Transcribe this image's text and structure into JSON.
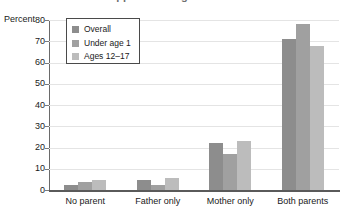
{
  "chart_data": {
    "type": "bar",
    "title": "",
    "xlabel": "",
    "ylabel": "Percent",
    "ylim": [
      0,
      80
    ],
    "yticks": [
      0,
      10,
      20,
      30,
      40,
      50,
      60,
      70,
      80
    ],
    "ytick_labels": [
      "0",
      "10",
      "20",
      "30",
      "40",
      "50",
      "60",
      "70",
      "80"
    ],
    "grid": true,
    "legend_position": "upper-left-inside",
    "categories": [
      "No parent",
      "Father only",
      "Mother only",
      "Both parents"
    ],
    "series": [
      {
        "name": "Overall",
        "color": "#8d8d8d",
        "values": [
          2.5,
          4.5,
          22,
          71
        ]
      },
      {
        "name": "Under age 1",
        "color": "#a0a0a0",
        "values": [
          4,
          2.5,
          17,
          78
        ]
      },
      {
        "name": "Ages 12–17",
        "color": "#bcbcbc",
        "values": [
          4.5,
          5.5,
          23,
          68
        ]
      }
    ]
  },
  "axis": {
    "y_title": "Percent"
  },
  "legend": {
    "entries": [
      {
        "label": "Overall",
        "color": "#8d8d8d"
      },
      {
        "label": "Under age 1",
        "color": "#a0a0a0"
      },
      {
        "label": "Ages 12–17",
        "color": "#bcbcbc"
      }
    ]
  },
  "title_fragment": {
    "text": "clipped heading"
  }
}
